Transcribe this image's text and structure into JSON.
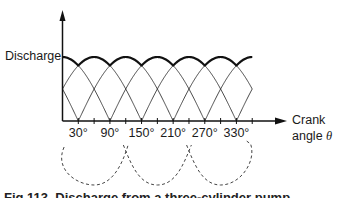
{
  "chart_data": {
    "type": "line",
    "title": "",
    "ylabel": "Discharge",
    "xlabel_line1": "Crank",
    "xlabel_line2": "angle",
    "xlabel_symbol": "θ",
    "xticks": [
      30,
      90,
      150,
      210,
      270,
      330
    ],
    "xtick_labels": [
      "30°",
      "90°",
      "150°",
      "210°",
      "270°",
      "330°"
    ],
    "minor_tick_step_deg": 30,
    "xlim": [
      0,
      360
    ],
    "ylim": [
      -0.6,
      1.0
    ],
    "grid": false,
    "legend": "none",
    "series": [
      {
        "name": "Individual cylinder discharge (half-sine lobes)",
        "style": "thin solid",
        "lobe_span_deg": 180,
        "lobe_starts_deg": [
          -150,
          -90,
          -30,
          30,
          90,
          150,
          210,
          270,
          330
        ],
        "amplitude": 1.0
      },
      {
        "name": "Total discharge (envelope)",
        "style": "bold solid",
        "peaks_deg": [
          0,
          60,
          120,
          180,
          240,
          300,
          360
        ],
        "peak_value": 1.0,
        "valleys_deg": [
          30,
          90,
          150,
          210,
          270,
          330
        ],
        "valley_value": 0.866
      },
      {
        "name": "Suction (dashed lobes below axis)",
        "style": "dashed",
        "centers_deg": [
          60,
          180,
          300
        ],
        "depth": -0.55
      }
    ]
  },
  "caption": "Fig 113. Discharge from a three-cylinder pump"
}
